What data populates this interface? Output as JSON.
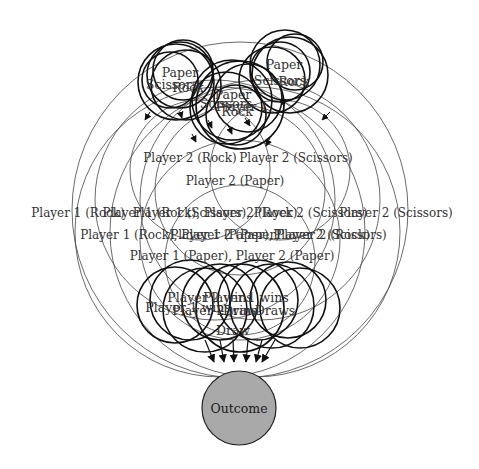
{
  "diagram": {
    "background": "#ffffff",
    "node_fill_outcome": "#a9a9a9",
    "top_cluster_left": {
      "labels": [
        "Paper",
        "Scissors",
        "Rock"
      ]
    },
    "top_cluster_center": {
      "labels": [
        "Paper",
        "Player 1",
        "Scissors",
        "Rock"
      ]
    },
    "top_cluster_right": {
      "labels": [
        "Paper",
        "Scissors",
        "Rock"
      ]
    },
    "player2_choices": [
      "Player 2 (Rock)",
      "Player 2 (Scissors)",
      "Player 2 (Paper)"
    ],
    "combination_rows": {
      "row1": {
        "left": "Player 1 (Rock), Player 2 (Rock)",
        "overlap": "Player 1 (Scissors), Player 2 (Rock)",
        "right": "Player 2 (Scissors)"
      },
      "row2": {
        "left": "Player 1 (Rock), Player 2 (Paper)",
        "overlap": "Player 1 (Paper), Player 2 (Rock)",
        "right": "Player 2 (Scissors)"
      },
      "row3": {
        "text": "Player 1 (Paper), Player 2 (Paper)"
      }
    },
    "row_labels": [
      "Player 1 (Rock)",
      "Player 1 (Rock), Player 2 (Rock)",
      "Player 1 (Scissors), Player 2 (Scissors)",
      "Player 2 (Scissors)",
      "Player 1 (Rock), Player 2 (Paper)",
      "Player 1 (Paper), Player 2 (Rock)",
      "Player 2 (Scissors)",
      "Player 1 (Paper), Player 2 (Paper)"
    ],
    "results": {
      "labels": [
        "Player 2 wins",
        "Player 1 wins",
        "Draw",
        "Player 1 wins",
        "Draws",
        "Player 2 wins",
        "Draw"
      ]
    },
    "outcome_node": {
      "label": "Outcome"
    }
  }
}
